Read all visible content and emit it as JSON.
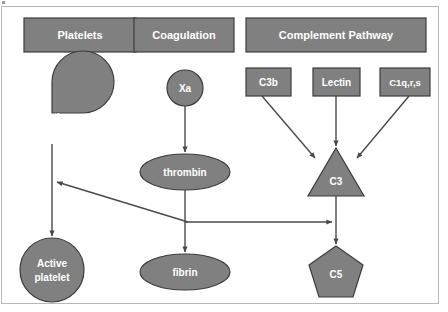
{
  "figure": {
    "background_color": "#ffffff",
    "node_fill_color": "#808080",
    "node_stroke_color": "#3c3c3c",
    "label_color": "#ffffff",
    "arrow_color": "#4a4a4a",
    "frame_color": "#b9b9b9"
  },
  "headers": [
    {
      "id": "platelets",
      "label": "Platelets",
      "x": 24,
      "y": 18,
      "w": 112,
      "h": 34
    },
    {
      "id": "coagulation",
      "label": "Coagulation",
      "x": 134,
      "y": 18,
      "w": 100,
      "h": 34
    },
    {
      "id": "complement",
      "label": "Complement Pathway",
      "x": 246,
      "y": 18,
      "w": 180,
      "h": 34
    }
  ],
  "nodes": [
    {
      "id": "inactive",
      "label": "Inactive",
      "shape": "pacman",
      "cx": 52,
      "cy": 113,
      "r": 31
    },
    {
      "id": "active-platelet",
      "label": "Active platelet",
      "label_lines": [
        "Active",
        "platelet"
      ],
      "shape": "circle",
      "cx": 52,
      "cy": 270,
      "r": 32
    },
    {
      "id": "xa",
      "label": "Xa",
      "shape": "circle",
      "cx": 185,
      "cy": 88,
      "r": 18
    },
    {
      "id": "thrombin",
      "label": "thrombin",
      "shape": "ellipse",
      "cx": 185,
      "cy": 172,
      "rx": 45,
      "ry": 18
    },
    {
      "id": "fibrin",
      "label": "fibrin",
      "shape": "ellipse",
      "cx": 185,
      "cy": 272,
      "rx": 45,
      "ry": 18
    },
    {
      "id": "c3b",
      "label": "C3b",
      "shape": "rect",
      "x": 246,
      "y": 68,
      "w": 45,
      "h": 28
    },
    {
      "id": "lectin",
      "label": "Lectin",
      "shape": "rect",
      "x": 313,
      "y": 68,
      "w": 47,
      "h": 28
    },
    {
      "id": "c1qrs",
      "label": "C1q,r,s",
      "shape": "rect",
      "x": 380,
      "y": 68,
      "w": 50,
      "h": 28
    },
    {
      "id": "c3",
      "label": "C3",
      "shape": "triangle",
      "cx": 336,
      "cy": 172,
      "half_w": 28,
      "half_h": 24
    },
    {
      "id": "c5",
      "label": "C5",
      "shape": "pentagon",
      "cx": 336,
      "cy": 272,
      "r": 28
    }
  ],
  "edges": [
    {
      "id": "inactive-to-active",
      "from": "inactive",
      "to": "active-platelet",
      "kind": "arrow"
    },
    {
      "id": "xa-to-thrombin",
      "from": "xa",
      "to": "thrombin",
      "kind": "arrow"
    },
    {
      "id": "thrombin-to-fibrin",
      "from": "thrombin",
      "to": "fibrin",
      "kind": "arrow"
    },
    {
      "id": "c3b-to-c3",
      "from": "c3b",
      "to": "c3",
      "kind": "arrow"
    },
    {
      "id": "lectin-to-c3",
      "from": "lectin",
      "to": "c3",
      "kind": "arrow"
    },
    {
      "id": "c1qrs-to-c3",
      "from": "c1qrs",
      "to": "c3",
      "kind": "arrow"
    },
    {
      "id": "c3-to-c5",
      "from": "c3",
      "to": "c5",
      "kind": "arrow"
    },
    {
      "id": "c5-branch-to-platelet-line",
      "from": "c5-branch",
      "to": "inactive-to-active",
      "kind": "arrow-diagonal"
    },
    {
      "id": "thrombin-branch-to-c5-line",
      "from": "thrombin-branch",
      "to": "c3-to-c5",
      "kind": "arrow-horizontal"
    }
  ]
}
